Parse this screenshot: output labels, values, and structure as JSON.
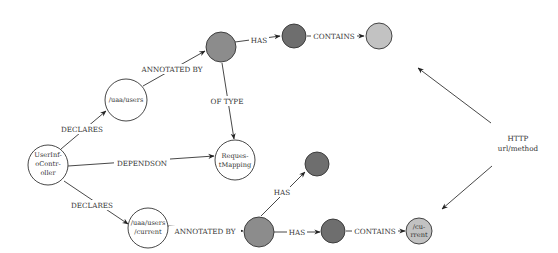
{
  "diagram": {
    "title": "",
    "colors": {
      "white_node": "#ffffff",
      "mid_gray": "#8c8c8c",
      "dark_gray": "#6e6e6e",
      "light_gray": "#c2c2c2",
      "stroke": "#333333"
    },
    "nodes": {
      "controller": {
        "lines": [
          "UserInf-",
          "oContr-",
          "oller"
        ]
      },
      "users": {
        "label": "/uaa/users"
      },
      "request_mapping": {
        "lines": [
          "Reques-",
          "tMapping"
        ]
      },
      "users_current": {
        "lines": [
          "/uaa/users",
          "/current"
        ]
      },
      "current_leaf": {
        "lines": [
          "/cu-",
          "rrent"
        ]
      }
    },
    "edges": {
      "declares_top": "DECLARES",
      "declares_bottom": "DECLARES",
      "dependson": "DEPENDSON",
      "annotated_top": "ANNOTATED BY",
      "annotated_bottom": "ANNOTATED BY",
      "of_type": "OF TYPE",
      "has_top": "HAS",
      "contains_top": "CONTAINS",
      "has_bottom_up": "HAS",
      "has_bottom": "HAS",
      "contains_bottom": "CONTAINS"
    },
    "http_label": {
      "line1": "HTTP",
      "line2": "url/method"
    }
  }
}
